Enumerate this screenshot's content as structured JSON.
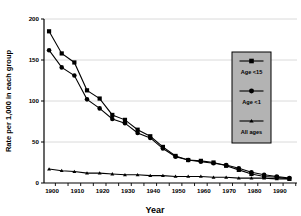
{
  "chart_data": {
    "type": "line",
    "title": "",
    "xlabel": "Year",
    "ylabel": "Rate per 1,000 in each group",
    "xlim": [
      1898,
      1998
    ],
    "ylim": [
      0,
      200
    ],
    "yticks": [
      0,
      50,
      100,
      150,
      200
    ],
    "xticks": [
      1900,
      1910,
      1920,
      1930,
      1940,
      1950,
      1960,
      1970,
      1980,
      1990
    ],
    "grid": "horizontal",
    "legend_position": "right",
    "x": [
      1900,
      1905,
      1910,
      1915,
      1920,
      1925,
      1930,
      1935,
      1940,
      1945,
      1950,
      1955,
      1960,
      1965,
      1970,
      1975,
      1980,
      1985,
      1990,
      1995
    ],
    "series": [
      {
        "name": "Age <15",
        "marker": "square",
        "values": [
          185,
          158,
          147,
          113,
          103,
          83,
          77,
          65,
          57,
          44,
          33,
          28,
          27,
          25,
          21,
          16,
          11,
          8,
          7,
          5
        ]
      },
      {
        "name": "Age <1",
        "marker": "circle",
        "values": [
          162,
          141,
          131,
          102,
          91,
          78,
          73,
          61,
          55,
          42,
          32,
          28,
          26,
          24,
          22,
          18,
          13,
          10,
          8,
          6
        ]
      },
      {
        "name": "All ages",
        "marker": "triangle",
        "values": [
          17,
          15,
          14,
          12,
          12,
          11,
          10,
          10,
          9,
          9,
          8,
          8,
          8,
          7,
          7,
          6,
          6,
          6,
          5,
          5
        ]
      }
    ]
  },
  "legend": {
    "entries": [
      {
        "label": "Age <15",
        "marker": "square"
      },
      {
        "label": "Age <1",
        "marker": "circle"
      },
      {
        "label": "All ages",
        "marker": "triangle"
      }
    ],
    "background_color": "#b3b3b3",
    "border_color": "#000000"
  },
  "colors": {
    "series_line": "#000000",
    "grid": "#d0d0d0",
    "axis": "#000000",
    "background": "#ffffff"
  }
}
